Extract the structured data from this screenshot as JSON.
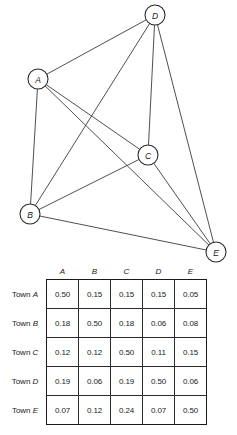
{
  "figure": {
    "graph": {
      "type": "network-graph",
      "nodes": [
        {
          "id": "A",
          "label": "A",
          "x": 38,
          "y": 79,
          "r": 10
        },
        {
          "id": "B",
          "label": "B",
          "x": 30,
          "y": 214,
          "r": 10
        },
        {
          "id": "C",
          "label": "C",
          "x": 148,
          "y": 155,
          "r": 10
        },
        {
          "id": "D",
          "label": "D",
          "x": 155,
          "y": 15,
          "r": 10
        },
        {
          "id": "E",
          "label": "E",
          "x": 216,
          "y": 252,
          "r": 10
        }
      ],
      "edges": [
        {
          "from": "A",
          "to": "B"
        },
        {
          "from": "A",
          "to": "C"
        },
        {
          "from": "A",
          "to": "D"
        },
        {
          "from": "A",
          "to": "E"
        },
        {
          "from": "B",
          "to": "C"
        },
        {
          "from": "B",
          "to": "D"
        },
        {
          "from": "B",
          "to": "E"
        },
        {
          "from": "C",
          "to": "D"
        },
        {
          "from": "C",
          "to": "E"
        },
        {
          "from": "D",
          "to": "E"
        }
      ],
      "stroke_color": "#3b3b3b",
      "node_fill": "#ffffff",
      "node_stroke": "#2b2b2b"
    }
  },
  "chart_data": {
    "type": "table",
    "title": "",
    "column_headers": [
      "A",
      "B",
      "C",
      "D",
      "E"
    ],
    "row_headers": [
      "Town A",
      "Town B",
      "Town C",
      "Town D",
      "Town E"
    ],
    "rows": [
      {
        "label": "Town A",
        "label_prefix": "Town",
        "label_letter": "A",
        "values": [
          "0.50",
          "0.15",
          "0.15",
          "0.15",
          "0.05"
        ]
      },
      {
        "label": "Town B",
        "label_prefix": "Town",
        "label_letter": "B",
        "values": [
          "0.18",
          "0.50",
          "0.18",
          "0.06",
          "0.08"
        ]
      },
      {
        "label": "Town C",
        "label_prefix": "Town",
        "label_letter": "C",
        "values": [
          "0.12",
          "0.12",
          "0.50",
          "0.11",
          "0.15"
        ]
      },
      {
        "label": "Town D",
        "label_prefix": "Town",
        "label_letter": "D",
        "values": [
          "0.19",
          "0.06",
          "0.19",
          "0.50",
          "0.06"
        ]
      },
      {
        "label": "Town E",
        "label_prefix": "Town",
        "label_letter": "E",
        "values": [
          "0.07",
          "0.12",
          "0.24",
          "0.07",
          "0.50"
        ]
      }
    ],
    "xlabel": "",
    "ylabel": "",
    "grid": true,
    "legend": "none"
  }
}
